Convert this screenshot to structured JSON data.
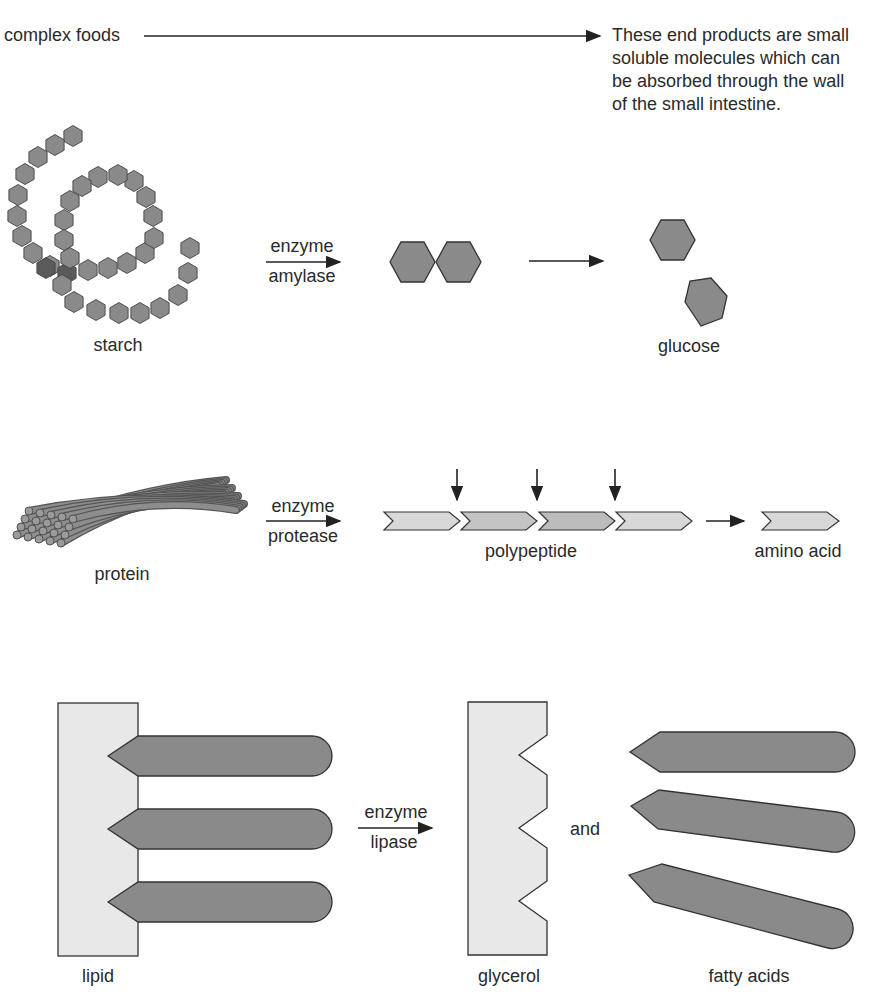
{
  "header": {
    "source_label": "complex foods",
    "end_note": "These end products are small soluble molecules which can be absorbed through the wall of the small intestine."
  },
  "starch_row": {
    "input_label": "starch",
    "enzyme_top": "enzyme",
    "enzyme_bottom": "amylase",
    "product_label": "glucose"
  },
  "protein_row": {
    "input_label": "protein",
    "enzyme_top": "enzyme",
    "enzyme_bottom": "protease",
    "intermediate_label": "polypeptide",
    "product_label": "amino acid"
  },
  "lipid_row": {
    "input_label": "lipid",
    "enzyme_top": "enzyme",
    "enzyme_bottom": "lipase",
    "product1_label": "glycerol",
    "connector": "and",
    "product2_label": "fatty acids"
  },
  "colors": {
    "dark_fill": "#8a8a8a",
    "light_fill": "#e6e6e6",
    "mid_fill": "#c4c4c4",
    "stroke": "#333333"
  }
}
